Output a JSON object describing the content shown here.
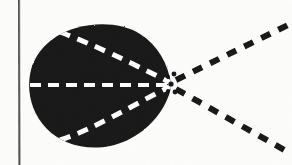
{
  "figure": {
    "title": "Scanned line-art diagram: dark lobe with converging dashed chords and three dashed rays",
    "caption": "",
    "background_color": "#fdfdfc",
    "ink_color": "#141414",
    "dash_color": "#ffffff",
    "canvas": {
      "width": 292,
      "height": 165
    }
  },
  "border": {
    "name": "left-rule",
    "orientation": "vertical",
    "x": 19,
    "y_start": 0,
    "y_end": 165,
    "thickness": 1.6,
    "color": "#2a2a2a"
  },
  "lobe": {
    "name": "filled-lobe",
    "description": "solid black teardrop / egg shape, rounded at left, tapering to a point at the right",
    "fill": "#141414",
    "bounds": {
      "left": 30,
      "top": 26,
      "right": 172,
      "bottom": 146
    },
    "apex": {
      "x": 171,
      "y": 84
    },
    "center": {
      "x": 98,
      "y": 86
    }
  },
  "convergence_point": {
    "name": "focus-point",
    "x": 171,
    "y": 84
  },
  "interior_dashes": [
    {
      "name": "interior-dash-axis",
      "color": "#ffffff",
      "from": {
        "x": 30,
        "y": 86
      },
      "to": {
        "x": 170,
        "y": 84
      },
      "dash": "11 7",
      "width": 6
    },
    {
      "name": "interior-dash-upper-chord",
      "color": "#ffffff",
      "from": {
        "x": 62,
        "y": 33
      },
      "to": {
        "x": 170,
        "y": 83
      },
      "dash": "11 8",
      "width": 5
    },
    {
      "name": "interior-dash-lower-chord",
      "color": "#ffffff",
      "from": {
        "x": 62,
        "y": 139
      },
      "to": {
        "x": 170,
        "y": 86
      },
      "dash": "11 8",
      "width": 5
    }
  ],
  "rays": [
    {
      "name": "ray-upper",
      "color": "#141414",
      "from": {
        "x": 176,
        "y": 80
      },
      "to": {
        "x": 288,
        "y": 25
      },
      "dash": "10 9",
      "width": 6,
      "angle_deg": -26
    },
    {
      "name": "ray-middle",
      "color": "#141414",
      "from": {
        "x": 178,
        "y": 84
      },
      "to": {
        "x": 292,
        "y": 84
      },
      "dash": "11 9",
      "width": 7,
      "angle_deg": 0
    },
    {
      "name": "ray-lower",
      "color": "#141414",
      "from": {
        "x": 176,
        "y": 89
      },
      "to": {
        "x": 288,
        "y": 152
      },
      "dash": "10 9",
      "width": 6,
      "angle_deg": 29
    }
  ],
  "focus_specks": [
    {
      "name": "focus-speck-1",
      "x": 174,
      "y": 74,
      "r": 2.4
    },
    {
      "name": "focus-speck-2",
      "x": 175,
      "y": 92,
      "r": 2.4
    },
    {
      "name": "focus-speck-3",
      "x": 168,
      "y": 77,
      "r": 2.0
    },
    {
      "name": "focus-speck-4",
      "x": 168,
      "y": 91,
      "r": 2.0
    }
  ]
}
